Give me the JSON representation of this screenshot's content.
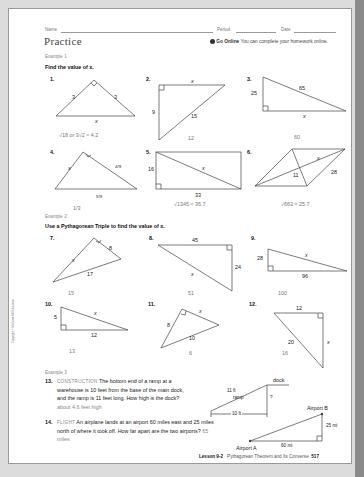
{
  "header": {
    "name_label": "Name",
    "period_label": "Period",
    "date_label": "Date",
    "title": "Practice",
    "go_online_label": "Go Online",
    "go_online_text": "You can complete your homework online."
  },
  "example1": {
    "label": "Example 1",
    "instruction": "Find the value of x.",
    "problems": [
      {
        "num": "1.",
        "labels": [
          "3",
          "3",
          "x"
        ],
        "answer": "√18 or 3√2 ≈ 4.2"
      },
      {
        "num": "2.",
        "labels": [
          "x",
          "9",
          "15"
        ],
        "answer": "12"
      },
      {
        "num": "3.",
        "labels": [
          "25",
          "65",
          "x"
        ],
        "answer": "60"
      },
      {
        "num": "4.",
        "labels": [
          "x",
          "4/9",
          "5/9"
        ],
        "answer": "1/3"
      },
      {
        "num": "5.",
        "labels": [
          "16",
          "x",
          "33"
        ],
        "answer": "√1345 ≈ 36.7"
      },
      {
        "num": "6.",
        "labels": [
          "x",
          "11",
          "28"
        ],
        "answer": "√663 ≈ 25.7"
      }
    ]
  },
  "example2": {
    "label": "Example 2",
    "instruction": "Use a Pythagorean Triple to find the value of x.",
    "problems": [
      {
        "num": "7.",
        "labels": [
          "x",
          "8",
          "17"
        ],
        "answer": "15"
      },
      {
        "num": "8.",
        "labels": [
          "45",
          "24",
          "x"
        ],
        "answer": "51"
      },
      {
        "num": "9.",
        "labels": [
          "28",
          "x",
          "96"
        ],
        "answer": "100"
      },
      {
        "num": "10.",
        "labels": [
          "5",
          "x",
          "12"
        ],
        "answer": "13"
      },
      {
        "num": "11.",
        "labels": [
          "8",
          "x",
          "10"
        ],
        "answer": "6"
      },
      {
        "num": "12.",
        "labels": [
          "12",
          "20",
          "x"
        ],
        "answer": "16"
      }
    ]
  },
  "example3": {
    "label": "Example 3",
    "problems": [
      {
        "num": "13.",
        "category": "CONSTRUCTION",
        "text": "The bottom end of a ramp at a warehouse is 10 feet from the base of the main dock, and the ramp is 11 feet long. How high is the dock?",
        "answer": "about 4.6 feet high",
        "diagram": {
          "dock": "dock",
          "ramp_len": "11 ft",
          "ramp": "ramp",
          "height": "?",
          "base": "10 ft"
        }
      },
      {
        "num": "14.",
        "category": "FLIGHT",
        "text": "An airplane lands at an airport 60 miles east and 25 miles north of where it took off. How far apart are the two airports?",
        "answer": "65 miles",
        "diagram": {
          "a": "Airport A",
          "b": "Airport B",
          "east": "60 mi",
          "north": "25 mi"
        }
      }
    ]
  },
  "footer": {
    "lesson": "Lesson 9-2",
    "title": "· Pythagorean Theorem and Its Converse",
    "page": "517"
  },
  "copyright": "Copyright © McGraw-Hill Education"
}
